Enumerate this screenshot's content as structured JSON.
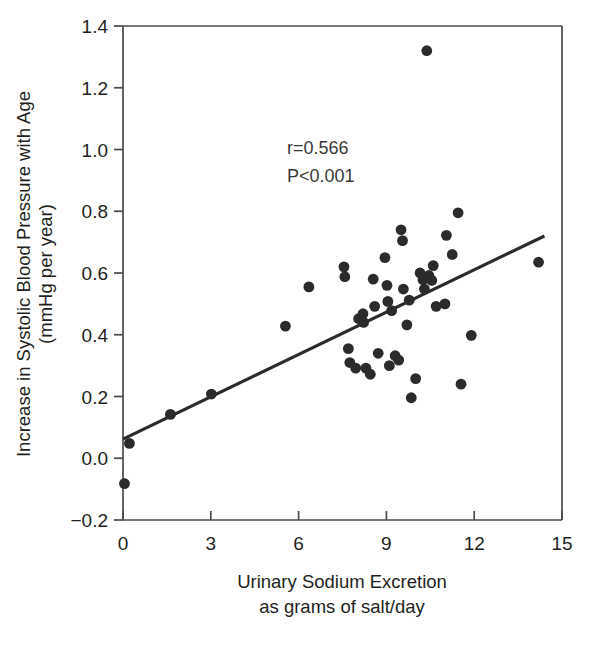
{
  "chart_data": {
    "type": "scatter",
    "title": "",
    "xlabel": "Urinary Sodium Excretion as grams of salt/day",
    "xlabel_line1": "Urinary Sodium Excretion",
    "xlabel_line2": "as grams of salt/day",
    "ylabel": "Increase in Systolic Blood Pressure with Age (mmHg per year)",
    "ylabel_line1": "Increase in Systolic Blood Pressure with Age",
    "ylabel_line2": "(mmHg per year)",
    "xlim": [
      0,
      15
    ],
    "ylim": [
      -0.2,
      1.4
    ],
    "xticks": [
      0,
      3,
      6,
      9,
      12,
      15
    ],
    "xtick_labels": [
      "0",
      "3",
      "6",
      "9",
      "12",
      "15"
    ],
    "yticks": [
      -0.2,
      0.0,
      0.2,
      0.4,
      0.6,
      0.8,
      1.0,
      1.2,
      1.4
    ],
    "ytick_labels": [
      "−0.2",
      "0.0",
      "0.2",
      "0.4",
      "0.6",
      "0.8",
      "1.0",
      "1.2",
      "1.4"
    ],
    "grid": false,
    "legend": false,
    "marker_color": "#2b2b2b",
    "line_color": "#2b2b2b",
    "annotations": [
      {
        "text": "r=0.566",
        "x": 5.6,
        "y": 0.985
      },
      {
        "text": "P<0.001",
        "x": 5.6,
        "y": 0.895
      }
    ],
    "statistics": {
      "correlation_label": "r=0.566",
      "correlation_value": 0.566,
      "p_value_label": "P<0.001"
    },
    "regression_line": {
      "x": [
        0.0,
        14.4
      ],
      "y": [
        0.062,
        0.72
      ],
      "slope": 0.0457,
      "intercept": 0.062
    },
    "points": [
      {
        "x": 0.05,
        "y": -0.082
      },
      {
        "x": 0.22,
        "y": 0.048
      },
      {
        "x": 1.62,
        "y": 0.142
      },
      {
        "x": 3.02,
        "y": 0.208
      },
      {
        "x": 5.55,
        "y": 0.428
      },
      {
        "x": 6.35,
        "y": 0.555
      },
      {
        "x": 7.55,
        "y": 0.62
      },
      {
        "x": 7.58,
        "y": 0.588
      },
      {
        "x": 7.7,
        "y": 0.355
      },
      {
        "x": 7.75,
        "y": 0.31
      },
      {
        "x": 7.95,
        "y": 0.292
      },
      {
        "x": 8.05,
        "y": 0.452
      },
      {
        "x": 8.2,
        "y": 0.468
      },
      {
        "x": 8.22,
        "y": 0.44
      },
      {
        "x": 8.3,
        "y": 0.292
      },
      {
        "x": 8.45,
        "y": 0.272
      },
      {
        "x": 8.55,
        "y": 0.58
      },
      {
        "x": 8.6,
        "y": 0.492
      },
      {
        "x": 8.72,
        "y": 0.34
      },
      {
        "x": 8.95,
        "y": 0.65
      },
      {
        "x": 9.02,
        "y": 0.56
      },
      {
        "x": 9.05,
        "y": 0.508
      },
      {
        "x": 9.1,
        "y": 0.3
      },
      {
        "x": 9.18,
        "y": 0.478
      },
      {
        "x": 9.3,
        "y": 0.332
      },
      {
        "x": 9.42,
        "y": 0.318
      },
      {
        "x": 9.5,
        "y": 0.74
      },
      {
        "x": 9.55,
        "y": 0.705
      },
      {
        "x": 9.58,
        "y": 0.548
      },
      {
        "x": 9.7,
        "y": 0.432
      },
      {
        "x": 9.78,
        "y": 0.512
      },
      {
        "x": 9.85,
        "y": 0.196
      },
      {
        "x": 10.0,
        "y": 0.258
      },
      {
        "x": 10.15,
        "y": 0.6
      },
      {
        "x": 10.25,
        "y": 0.578
      },
      {
        "x": 10.3,
        "y": 0.548
      },
      {
        "x": 10.38,
        "y": 1.32
      },
      {
        "x": 10.45,
        "y": 0.592
      },
      {
        "x": 10.55,
        "y": 0.576
      },
      {
        "x": 10.6,
        "y": 0.624
      },
      {
        "x": 10.7,
        "y": 0.492
      },
      {
        "x": 11.0,
        "y": 0.5
      },
      {
        "x": 11.05,
        "y": 0.722
      },
      {
        "x": 11.25,
        "y": 0.66
      },
      {
        "x": 11.45,
        "y": 0.795
      },
      {
        "x": 11.55,
        "y": 0.24
      },
      {
        "x": 11.9,
        "y": 0.398
      },
      {
        "x": 14.2,
        "y": 0.635
      }
    ],
    "n_points": 48
  }
}
